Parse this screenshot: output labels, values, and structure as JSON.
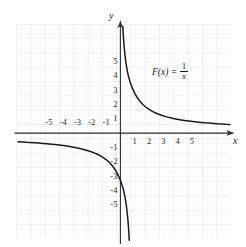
{
  "figure": {
    "background_color": "#ffffff",
    "curve_color": "#1a1a1a",
    "axis_color": "#2b2b2b",
    "grid_major_color": "#b9b9b9",
    "grid_minor_color": "#dcdcdc"
  },
  "formula": {
    "function_name": "F(x)",
    "equals": "=",
    "numerator": "1",
    "denominator": "x",
    "full_text": "F(x) = 1/x"
  },
  "axes": {
    "x_label": "x",
    "y_label": "y",
    "x_arrow": "arrow-right",
    "y_arrow": "arrow-up"
  },
  "chart_data": {
    "type": "line",
    "xlabel": "x",
    "ylabel": "y",
    "grid": true,
    "legend": "none",
    "annotations": [
      {
        "text": "F(x) = 1/x",
        "x": 3.2,
        "y": 3.2
      }
    ],
    "xlim": [
      -6.2,
      6.2
    ],
    "ylim": [
      -6.2,
      6.2
    ],
    "xticks": [
      -5,
      -4,
      -3,
      -2,
      -1,
      1,
      2,
      3,
      4,
      5
    ],
    "yticks": [
      -5,
      -4,
      -3,
      -2,
      -1,
      1,
      2,
      3,
      4,
      5
    ],
    "xtick_labels": [
      "-5",
      "-4",
      "-3",
      "-2",
      "-1",
      "1",
      "2",
      "3",
      "4",
      "5"
    ],
    "ytick_labels": [
      "-5",
      "-4",
      "-3",
      "-2",
      "-1",
      "1",
      "2",
      "3",
      "4",
      "5"
    ],
    "minor_ticks_per_unit": 3,
    "series": [
      {
        "name": "F(x) = 1/x  (x > 0)",
        "branch": "positive",
        "x": [
          0.17,
          0.2,
          0.25,
          0.3,
          0.35,
          0.4,
          0.5,
          0.6,
          0.7,
          0.8,
          0.9,
          1.0,
          1.2,
          1.5,
          1.8,
          2.0,
          2.5,
          3.0,
          3.5,
          4.0,
          4.5,
          5.0,
          5.5,
          6.0
        ],
        "y": [
          5.88,
          5.0,
          4.0,
          3.33,
          2.86,
          2.5,
          2.0,
          1.67,
          1.43,
          1.25,
          1.11,
          1.0,
          0.83,
          0.67,
          0.56,
          0.5,
          0.4,
          0.33,
          0.29,
          0.25,
          0.22,
          0.2,
          0.18,
          0.17
        ]
      },
      {
        "name": "F(x) = 1/x  (x < 0)",
        "branch": "negative",
        "x": [
          -6.0,
          -5.5,
          -5.0,
          -4.5,
          -4.0,
          -3.5,
          -3.0,
          -2.5,
          -2.0,
          -1.8,
          -1.5,
          -1.2,
          -1.0,
          -0.9,
          -0.8,
          -0.7,
          -0.6,
          -0.5,
          -0.4,
          -0.35,
          -0.3,
          -0.25,
          -0.2,
          -0.17
        ],
        "y": [
          -0.17,
          -0.18,
          -0.2,
          -0.22,
          -0.25,
          -0.29,
          -0.33,
          -0.4,
          -0.5,
          -0.56,
          -0.67,
          -0.83,
          -1.0,
          -1.11,
          -1.25,
          -1.43,
          -1.67,
          -2.0,
          -2.5,
          -2.86,
          -3.33,
          -4.0,
          -5.0,
          -5.88
        ]
      }
    ]
  }
}
